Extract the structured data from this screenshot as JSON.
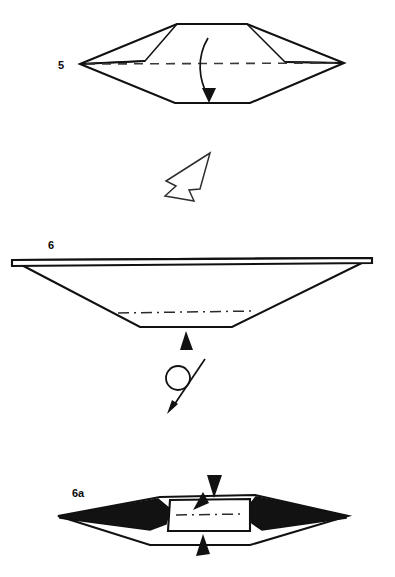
{
  "document": {
    "title": "Origami folding instructions",
    "background_color": "#ffffff",
    "ink_color": "#111111",
    "width": 395,
    "height": 577
  },
  "steps": [
    {
      "id": "step-5",
      "label": "5",
      "label_x": 58,
      "label_y": 69,
      "description": "Wide elongated hexagonal form, valley fold the front flap down along the horizontal center line",
      "outline": "80,64 177,24 247,24 344,63 250,103 175,103",
      "fold_lines": [
        {
          "name": "center-horizontal-dashed",
          "type": "dashed",
          "d": "M 86,64 L 338,63"
        }
      ],
      "inner_edges": [
        {
          "name": "left-inner-fold",
          "d": "M 80,64 L 145,61 L 177,24"
        },
        {
          "name": "left-inner-fold-lower",
          "d": "M 80,64 L 145,61"
        },
        {
          "name": "right-inner-fold",
          "d": "M 344,63 L 285,62 L 247,24"
        },
        {
          "name": "right-inner-fold-lower",
          "d": "M 344,63 L 285,62"
        }
      ],
      "motion_arrow": {
        "name": "fold-down-arrow",
        "path": "M 208,38 C 196,58 199,80 208,96",
        "head": "209,103 202,88 216,88"
      }
    },
    {
      "id": "step-6",
      "label": "6",
      "label_x": 48,
      "label_y": 249,
      "description": "Result seen from the side as a shallow trapezoid; push the bottom edge in the direction of the arrow",
      "outline": "12,260 372,258 232,327 140,327",
      "rim": "M 12,260 L 372,258 L 372,263 L 12,266 Z",
      "fold_lines": [
        {
          "name": "center-dashdot",
          "type": "dashdot",
          "d": "M 118,313 L 253,311"
        }
      ],
      "motion_arrow": {
        "name": "push-up-arrowhead",
        "head": "186,331 180,350 193,350"
      }
    },
    {
      "id": "step-6a",
      "label": "6a",
      "label_x": 72,
      "label_y": 497,
      "description": "Top view of the shape showing shaded inner faces; open out along the arrows",
      "outline": "58,516 160,497 255,495 348,516 250,545 150,545",
      "inner_box": "M 170,500 L 250,499 L 250,531 L 168,531 Z",
      "dark_faces": [
        {
          "name": "left-dark-wedge",
          "points": "60,516 158,499 170,509 166,524 150,530 60,518"
        },
        {
          "name": "right-dark-wedge",
          "points": "346,516 256,497 248,507 252,523 262,530 346,518"
        }
      ],
      "fold_lines": [
        {
          "name": "center-dashdot",
          "type": "dashdot",
          "d": "M 176,515 L 245,514"
        }
      ],
      "motion_arrows": [
        {
          "name": "top-arrowhead-down",
          "head": "214,498 207,475 222,475"
        },
        {
          "name": "inner-arrowhead-down-left",
          "head": "193,510 203,492 209,503"
        },
        {
          "name": "bottom-arrowhead-up",
          "head": "203,534 196,556 210,554"
        }
      ]
    }
  ],
  "symbols": [
    {
      "id": "turn-over-arrow-upper",
      "name": "fold-direction-hollow-arrow",
      "description": "Hollow outline arrow pointing down-left between step 5 and step 6",
      "path": "M 210,153 L 166,181 L 176,186 L 165,196 L 194,201 L 189,190 L 200,189 Z"
    },
    {
      "id": "turn-over-symbol",
      "name": "turn-over-icon",
      "description": "Circle with diagonal arrow: turn the model over",
      "circle": {
        "cx": 178,
        "cy": 378,
        "r": 12
      },
      "line": "M 205,359 L 172,408",
      "head": "167,414 178,404 172,400"
    }
  ]
}
